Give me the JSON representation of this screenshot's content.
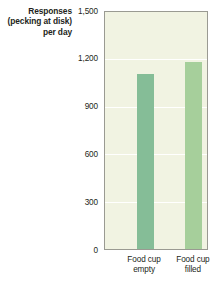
{
  "chart_data": {
    "type": "bar",
    "title": "",
    "subtitle": "",
    "ylabel_lines": [
      "Responses",
      "(pecking at disk)",
      "per day"
    ],
    "ylabel": "Responses (pecking at disk) per day",
    "xlabel": "",
    "categories": [
      "Food cup empty",
      "Food cup filled"
    ],
    "category_lines": [
      [
        "Food cup",
        "empty"
      ],
      [
        "Food cup",
        "filled"
      ]
    ],
    "values": [
      1100,
      1175
    ],
    "ylim": [
      0,
      1500
    ],
    "yticks": [
      0,
      300,
      600,
      900,
      1200,
      1500
    ],
    "ytick_labels": [
      "0",
      "300",
      "600",
      "900",
      "1,200",
      "1,500"
    ],
    "grid": true,
    "grid_orientation": "horizontal",
    "legend": false,
    "legend_position": "none",
    "bar_colors": [
      "#85bd97",
      "#a6cf9b"
    ],
    "plot_background": "#f1f3e2",
    "axis_color": "#9a9a92",
    "gridline_color": "#ffffff",
    "text_color": "#231f20"
  }
}
